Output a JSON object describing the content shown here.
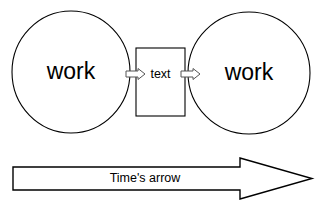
{
  "diagram": {
    "background_color": "#ffffff",
    "stroke_color": "#000000",
    "connector_stroke_color": "#555555",
    "nodes": {
      "left_circle": {
        "label": "work",
        "shape": "circle",
        "cx": 71,
        "cy": 72,
        "rx": 59,
        "ry": 61
      },
      "right_circle": {
        "label": "work",
        "shape": "circle",
        "cx": 249,
        "cy": 73,
        "rx": 61,
        "ry": 61
      },
      "center_box": {
        "label": "text",
        "shape": "rectangle",
        "x": 136,
        "y": 48,
        "width": 49,
        "height": 68
      }
    },
    "connectors": [
      {
        "name": "left-to-box",
        "direction": "right",
        "from": "left_circle",
        "to": "center_box"
      },
      {
        "name": "box-to-right",
        "direction": "right",
        "from": "center_box",
        "to": "right_circle"
      }
    ],
    "banner": {
      "label": "Time's arrow",
      "direction": "right",
      "x": 13,
      "y": 158,
      "width": 299,
      "height": 41
    }
  }
}
